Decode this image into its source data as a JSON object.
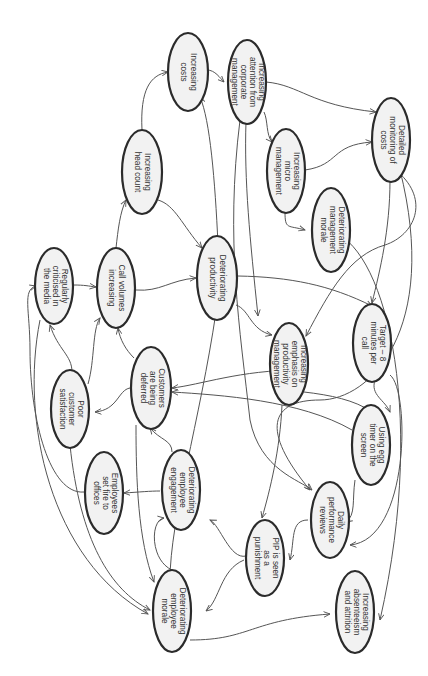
{
  "diagram": {
    "type": "causal loop diagram",
    "orientation": "rotated 90 degrees clockwise",
    "colors": {
      "node_fill": "#f2f2f2",
      "node_stroke": "#2b2b2b",
      "edge": "#555555",
      "text": "#333333",
      "background": "#ffffff"
    },
    "nodes": [
      {
        "id": "costs",
        "lines": [
          "Increasing",
          "costs"
        ]
      },
      {
        "id": "headcount",
        "lines": [
          "Increasing",
          "head count"
        ]
      },
      {
        "id": "corp_attention",
        "lines": [
          "Increasing",
          "attention from",
          "corporate",
          "management"
        ]
      },
      {
        "id": "micro_mgmt",
        "lines": [
          "Increasing",
          "micro",
          "management"
        ]
      },
      {
        "id": "detailed_monitoring",
        "lines": [
          "Detailed",
          "monitoring of",
          "costs"
        ]
      },
      {
        "id": "mgmt_morale",
        "lines": [
          "Deteriorating",
          "management",
          "morale"
        ]
      },
      {
        "id": "media",
        "lines": [
          "Regularly",
          "criticised in",
          "the media"
        ]
      },
      {
        "id": "call_volumes",
        "lines": [
          "Call volumes",
          "increasing"
        ]
      },
      {
        "id": "productivity",
        "lines": [
          "Deteriorating",
          "productivity"
        ]
      },
      {
        "id": "poor_satisfaction",
        "lines": [
          "Poor",
          "customer",
          "satisfaction"
        ]
      },
      {
        "id": "customers_deferred",
        "lines": [
          "Customers",
          "are being",
          "deferred"
        ]
      },
      {
        "id": "emphasis_productivity",
        "lines": [
          "Increasing",
          "emphasis on",
          "productivity",
          "management"
        ]
      },
      {
        "id": "target",
        "lines": [
          "Target – 8",
          "minutes per",
          "call"
        ]
      },
      {
        "id": "egg_timer",
        "lines": [
          "Using egg",
          "timer on the",
          "screen"
        ]
      },
      {
        "id": "fire",
        "lines": [
          "Employees",
          "set fire to",
          "offices"
        ]
      },
      {
        "id": "engagement",
        "lines": [
          "Deteriorating",
          "employee",
          "engagement"
        ]
      },
      {
        "id": "daily_reviews",
        "lines": [
          "Daily",
          "performance",
          "reviews"
        ]
      },
      {
        "id": "pip",
        "lines": [
          "PIP is seen",
          "as a",
          "punishment"
        ]
      },
      {
        "id": "employee_morale",
        "lines": [
          "Deteriorating",
          "employee",
          "morale"
        ]
      },
      {
        "id": "absenteeism",
        "lines": [
          "Increasing",
          "absenteeism",
          "and attrition"
        ]
      }
    ],
    "edges": [
      [
        "headcount",
        "costs"
      ],
      [
        "call_volumes",
        "headcount"
      ],
      [
        "headcount",
        "productivity"
      ],
      [
        "costs",
        "corp_attention"
      ],
      [
        "corp_attention",
        "micro_mgmt"
      ],
      [
        "corp_attention",
        "detailed_monitoring"
      ],
      [
        "micro_mgmt",
        "detailed_monitoring"
      ],
      [
        "micro_mgmt",
        "mgmt_morale"
      ],
      [
        "corp_attention",
        "emphasis_productivity"
      ],
      [
        "detailed_monitoring",
        "target"
      ],
      [
        "detailed_monitoring",
        "emphasis_productivity"
      ],
      [
        "media",
        "call_volumes"
      ],
      [
        "call_volumes",
        "productivity"
      ],
      [
        "productivity",
        "costs"
      ],
      [
        "productivity",
        "emphasis_productivity"
      ],
      [
        "productivity",
        "target"
      ],
      [
        "poor_satisfaction",
        "media"
      ],
      [
        "poor_satisfaction",
        "call_volumes"
      ],
      [
        "customers_deferred",
        "call_volumes"
      ],
      [
        "customers_deferred",
        "poor_satisfaction"
      ],
      [
        "emphasis_productivity",
        "egg_timer"
      ],
      [
        "emphasis_productivity",
        "customers_deferred"
      ],
      [
        "target",
        "egg_timer"
      ],
      [
        "target",
        "daily_reviews"
      ],
      [
        "egg_timer",
        "daily_reviews"
      ],
      [
        "egg_timer",
        "customers_deferred"
      ],
      [
        "mgmt_morale",
        "absenteeism"
      ],
      [
        "engagement",
        "fire"
      ],
      [
        "engagement",
        "customers_deferred"
      ],
      [
        "fire",
        "media"
      ],
      [
        "employee_morale",
        "engagement"
      ],
      [
        "employee_morale",
        "absenteeism"
      ],
      [
        "pip",
        "engagement"
      ],
      [
        "pip",
        "employee_morale"
      ],
      [
        "daily_reviews",
        "pip"
      ],
      [
        "emphasis_productivity",
        "pip"
      ],
      [
        "media",
        "employee_morale"
      ],
      [
        "poor_satisfaction",
        "employee_morale"
      ],
      [
        "productivity",
        "employee_morale"
      ]
    ]
  }
}
